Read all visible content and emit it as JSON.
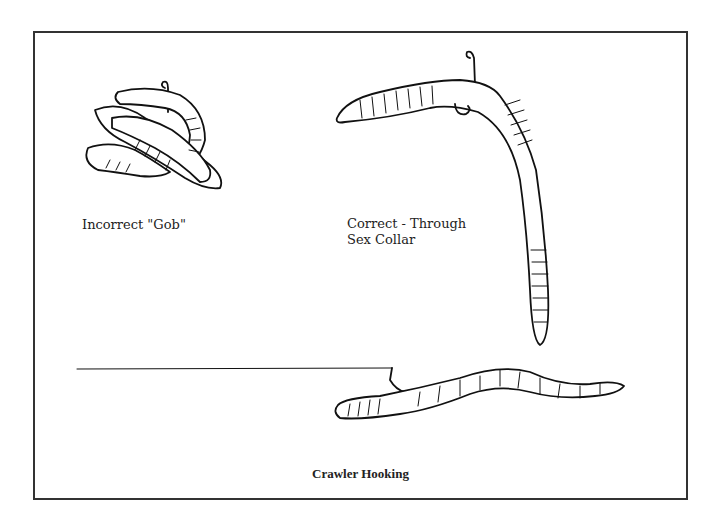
{
  "figure": {
    "title": "Crawler Hooking",
    "panels": [
      {
        "id": "incorrect",
        "label": "Incorrect \"Gob\""
      },
      {
        "id": "correct",
        "label_line1": "Correct - Through",
        "label_line2": "Sex Collar"
      },
      {
        "id": "rigged",
        "description": "Crawler hooked on line"
      }
    ]
  }
}
